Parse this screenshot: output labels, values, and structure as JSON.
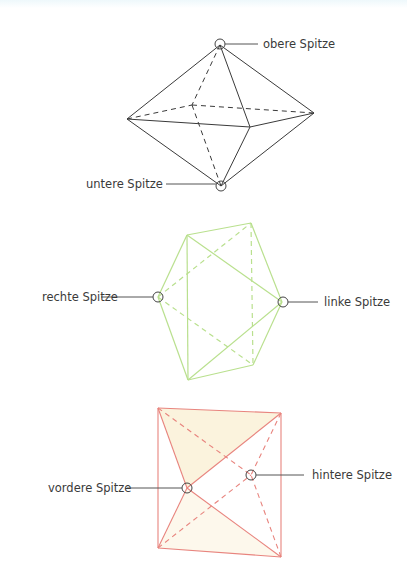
{
  "colors": {
    "figure1_stroke": "#3a3a3a",
    "figure2_stroke": "#b9e08e",
    "figure3_stroke": "#e8847e",
    "figure3_fill": "#fbf3dd",
    "marker": "#444444",
    "leader": "#555555"
  },
  "figures": [
    {
      "name": "octahedron-vertical",
      "labels": [
        {
          "id": "top",
          "text": "obere Spitze"
        },
        {
          "id": "bottom",
          "text": "untere Spitze"
        }
      ]
    },
    {
      "name": "octahedron-horizontal",
      "labels": [
        {
          "id": "right",
          "text": "rechte Spitze"
        },
        {
          "id": "left",
          "text": "linke Spitze"
        }
      ]
    },
    {
      "name": "octahedron-front",
      "labels": [
        {
          "id": "front",
          "text": "vordere Spitze"
        },
        {
          "id": "back",
          "text": "hintere Spitze"
        }
      ]
    }
  ]
}
